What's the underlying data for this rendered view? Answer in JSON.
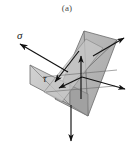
{
  "figure": {
    "caption": "(a)",
    "type": "stress-element-diagram"
  },
  "labels": {
    "sigma": "σ",
    "tau": "τ"
  },
  "colors": {
    "background": "#ffffff",
    "plane_main_fill": "#b4b4b4",
    "plane_left_fill": "#c9c9c9",
    "plane_inner_fill": "#9a9a9a",
    "plane_edge": "#6b6b6b",
    "vector_stroke": "#111111",
    "caption_text": "#4a4a4a",
    "label_text": "#1a1a1a"
  },
  "geometry": {
    "main_plane_points": "55,99 88,116 117,40 84,31",
    "left_plane_points": "30,65 55,80 55,99 30,84",
    "inner_plane_points": "55,80 88,97 88,116 55,99",
    "origin": [
      81,
      78
    ]
  },
  "vectors": [
    {
      "name": "sigma-vector",
      "label": "σ",
      "from": [
        66,
        71
      ],
      "to": [
        18,
        43
      ],
      "arrow": "up-left"
    },
    {
      "name": "tau-vector",
      "label": "τ",
      "from": [
        77,
        53
      ],
      "to": [
        52,
        80
      ],
      "arrow": "down-left"
    },
    {
      "name": "normal-up-vector",
      "label": "",
      "from": [
        81,
        98
      ],
      "to": [
        81,
        55
      ],
      "arrow": "up"
    },
    {
      "name": "shear-left-vector",
      "label": "",
      "from": [
        81,
        78
      ],
      "to": [
        57,
        88
      ],
      "arrow": "down-left"
    },
    {
      "name": "shear-right-vector",
      "label": "",
      "from": [
        81,
        78
      ],
      "to": [
        126,
        89
      ],
      "arrow": "down-right"
    },
    {
      "name": "upper-right-vector",
      "label": "",
      "from": [
        91,
        57
      ],
      "to": [
        124,
        38
      ],
      "arrow": "up-right"
    },
    {
      "name": "lower-vertical-vector",
      "label": "",
      "from": [
        71,
        104
      ],
      "to": [
        71,
        143
      ],
      "arrow": "down"
    }
  ],
  "label_positions": {
    "sigma": [
      17,
      36
    ],
    "tau": [
      44,
      80
    ]
  }
}
